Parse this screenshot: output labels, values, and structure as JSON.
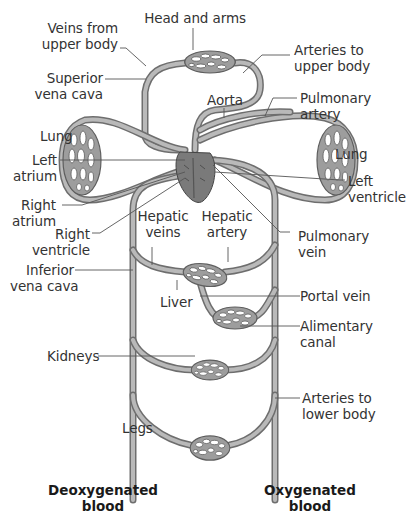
{
  "diagram": {
    "vessel_color": "#6e6e6e",
    "vessel_fill": "#b9b9b9",
    "heart_color": "#7a7a7a",
    "labels": {
      "head_and_arms": "Head and arms",
      "veins_from_upper_body": [
        "Veins from",
        "upper body"
      ],
      "arteries_to_upper_body": [
        "Arteries to",
        "upper body"
      ],
      "superior_vena_cava": [
        "Superior",
        "vena cava"
      ],
      "aorta": "Aorta",
      "pulmonary_artery": [
        "Pulmonary",
        "artery"
      ],
      "lung_left": "Lung",
      "lung_right": "Lung",
      "left_atrium": [
        "Left",
        "atrium"
      ],
      "right_atrium": [
        "Right",
        "atrium"
      ],
      "left_ventricle": [
        "Left",
        "ventricle"
      ],
      "right_ventricle": [
        "Right",
        "ventricle"
      ],
      "hepatic_veins": [
        "Hepatic",
        "veins"
      ],
      "hepatic_artery": [
        "Hepatic",
        "artery"
      ],
      "pulmonary_vein": [
        "Pulmonary",
        "vein"
      ],
      "inferior_vena_cava": [
        "Inferior",
        "vena cava"
      ],
      "liver": "Liver",
      "portal_vein": "Portal vein",
      "alimentary_canal": [
        "Alimentary",
        "canal"
      ],
      "kidneys": "Kidneys",
      "arteries_to_lower_body": [
        "Arteries to",
        "lower body"
      ],
      "legs": "Legs"
    },
    "legend": {
      "deoxygenated": [
        "Deoxygenated",
        "blood"
      ],
      "oxygenated": [
        "Oxygenated",
        "blood"
      ]
    }
  }
}
